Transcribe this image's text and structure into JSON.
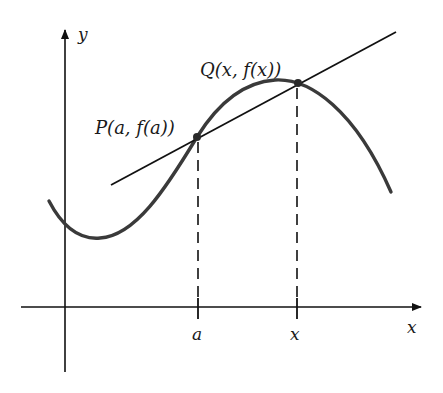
{
  "figure": {
    "axes": {
      "x_label": "x",
      "y_label": "y"
    },
    "points": {
      "P": {
        "label": "P(a, f(a))",
        "name": "P",
        "coords": "(a, f(a))"
      },
      "Q": {
        "label": "Q(x, f(x))",
        "name": "Q",
        "coords": "(x, f(x))"
      }
    },
    "ticks": {
      "a": "a",
      "x": "x"
    },
    "colors": {
      "curve": "#3a3a3a",
      "line": "#111111",
      "background": "#ffffff"
    }
  }
}
